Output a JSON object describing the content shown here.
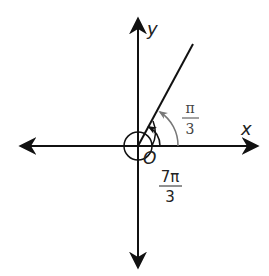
{
  "diagram": {
    "axis_x_label": "x",
    "axis_y_label": "y",
    "origin_label": "O",
    "angle_small": {
      "numerator": "π",
      "denominator": "3"
    },
    "angle_large": {
      "numerator": "7π",
      "denominator": "3"
    },
    "colors": {
      "axis": "#111111",
      "arc_small": "#777777",
      "arc_large": "#111111"
    }
  }
}
